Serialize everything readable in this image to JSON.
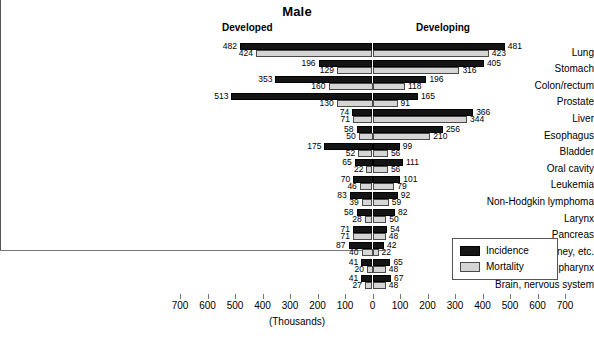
{
  "chart_data": {
    "type": "bar",
    "title": "Male",
    "xlabel": "(Thousands)",
    "ylabel": "",
    "orientation": "horizontal-diverging",
    "grid": false,
    "axis": {
      "ticks": [
        700,
        600,
        500,
        400,
        300,
        200,
        100,
        0,
        100,
        200,
        300,
        400,
        500,
        600,
        700
      ],
      "left_max": 700,
      "right_max": 700,
      "unit": "(Thousands)"
    },
    "panels": {
      "left": "Developed",
      "right": "Developing"
    },
    "legend": {
      "position": "bottom-right",
      "entries": [
        {
          "name": "Incidence",
          "color": "#141414"
        },
        {
          "name": "Mortality",
          "color": "#d5d5d5"
        }
      ]
    },
    "categories": [
      "Lung",
      "Stomach",
      "Colon/rectum",
      "Prostate",
      "Liver",
      "Esophagus",
      "Bladder",
      "Oral cavity",
      "Leukemia",
      "Non-Hodgkin lymphoma",
      "Larynx",
      "Pancreas",
      "Kidney, etc.",
      "Other pharynx",
      "Brain, nervous system"
    ],
    "series": [
      {
        "name": "Incidence",
        "side": "Developed",
        "values": [
          482,
          196,
          353,
          513,
          74,
          58,
          175,
          65,
          70,
          83,
          58,
          71,
          87,
          41,
          41
        ]
      },
      {
        "name": "Mortality",
        "side": "Developed",
        "values": [
          424,
          129,
          160,
          130,
          71,
          50,
          52,
          22,
          46,
          39,
          28,
          71,
          40,
          20,
          27
        ]
      },
      {
        "name": "Incidence",
        "side": "Developing",
        "values": [
          481,
          405,
          196,
          165,
          366,
          256,
          99,
          111,
          101,
          92,
          82,
          54,
          42,
          65,
          67
        ]
      },
      {
        "name": "Mortality",
        "side": "Developing",
        "values": [
          423,
          316,
          118,
          91,
          344,
          210,
          56,
          56,
          79,
          59,
          50,
          48,
          22,
          48,
          48
        ]
      }
    ]
  }
}
